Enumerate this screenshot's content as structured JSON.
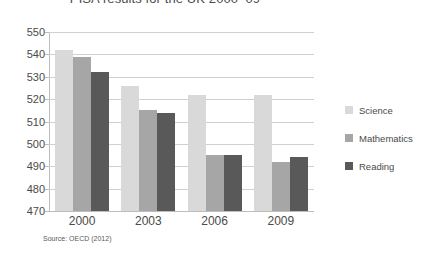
{
  "chart_data": {
    "type": "bar",
    "title": "PISA results for the UK 2000–09",
    "xlabel": "",
    "ylabel": "",
    "categories": [
      "2000",
      "2003",
      "2006",
      "2009"
    ],
    "series": [
      {
        "name": "Science",
        "color": "#d9d9d9",
        "values": [
          542,
          526,
          522,
          522
        ]
      },
      {
        "name": "Mathematics",
        "color": "#a6a6a6",
        "values": [
          539,
          515,
          495,
          492
        ]
      },
      {
        "name": "Reading",
        "color": "#595959",
        "values": [
          532,
          514,
          495,
          494
        ]
      }
    ],
    "ylim": [
      470,
      550
    ],
    "yticks": [
      470,
      480,
      490,
      500,
      510,
      520,
      530,
      540,
      550
    ],
    "ytick_labels": [
      "470",
      "480",
      "490",
      "500",
      "510",
      "520",
      "530",
      "540",
      "550"
    ],
    "grid": true,
    "legend_position": "right",
    "source_note": "Source: OECD (2012)"
  },
  "legend": {
    "items": [
      {
        "label": "Science"
      },
      {
        "label": "Mathematics"
      },
      {
        "label": "Reading"
      }
    ]
  }
}
